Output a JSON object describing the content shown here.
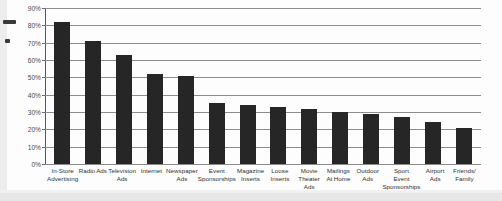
{
  "chart_data": {
    "type": "bar",
    "title": "",
    "subtitle": "",
    "xlabel": "",
    "ylabel": "",
    "ylim": [
      0,
      90
    ],
    "grid": true,
    "legend": false,
    "value_suffix": "%",
    "categories": [
      "In-Store Advertising",
      "Radio Ads",
      "Television Ads",
      "Internet",
      "Newspaper Ads",
      "Event Sponsorships",
      "Magazine Inserts",
      "Loose Inserts",
      "Movie Theater Ads",
      "Mailings At Home",
      "Outdoor Ads",
      "Sport Event Sponsorships",
      "Airport Ads",
      "Friends/ Family"
    ],
    "category_lines": [
      [
        "In-Store",
        "Advertising"
      ],
      [
        "Radio Ads"
      ],
      [
        "Television",
        "Ads"
      ],
      [
        "Internet"
      ],
      [
        "Newspaper",
        "Ads"
      ],
      [
        "Event",
        "Sponsorships"
      ],
      [
        "Magazine",
        "Inserts"
      ],
      [
        "Loose",
        "Inserts"
      ],
      [
        "Movie",
        "Theater Ads"
      ],
      [
        "Mailings",
        "At Home"
      ],
      [
        "Outdoor",
        "Ads"
      ],
      [
        "Sport",
        "Event",
        "Sponsorships"
      ],
      [
        "Airport Ads"
      ],
      [
        "Friends/",
        "Family"
      ]
    ],
    "values": [
      82,
      71,
      63,
      52,
      51,
      35,
      34,
      33,
      32,
      30,
      29,
      27,
      24,
      21
    ],
    "yticks": [
      0,
      10,
      20,
      30,
      40,
      50,
      60,
      70,
      80,
      90
    ],
    "ytick_labels": [
      "0%",
      "10%",
      "20%",
      "30%",
      "40%",
      "50%",
      "60%",
      "70%",
      "80%",
      "90%"
    ],
    "bar_color": "#262626",
    "grid_color": "#8c8c8c",
    "axis_color": "#555555",
    "background_color": "#fdfdfd"
  }
}
